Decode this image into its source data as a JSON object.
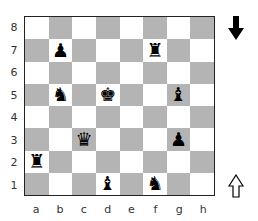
{
  "board": {
    "ranks": [
      "8",
      "7",
      "6",
      "5",
      "4",
      "3",
      "2",
      "1"
    ],
    "files": [
      "a",
      "b",
      "c",
      "d",
      "e",
      "f",
      "g",
      "h"
    ],
    "pieces": [
      {
        "square": "b7",
        "color": "black",
        "type": "pawn",
        "glyph": "♟"
      },
      {
        "square": "f7",
        "color": "black",
        "type": "rook",
        "glyph": "♜"
      },
      {
        "square": "b5",
        "color": "black",
        "type": "knight",
        "glyph": "♞"
      },
      {
        "square": "d5",
        "color": "black",
        "type": "king",
        "glyph": "♚"
      },
      {
        "square": "g5",
        "color": "black",
        "type": "bishop",
        "glyph": "♝"
      },
      {
        "square": "c3",
        "color": "black",
        "type": "queen",
        "glyph": "♛"
      },
      {
        "square": "g3",
        "color": "black",
        "type": "pawn",
        "glyph": "♟"
      },
      {
        "square": "a2",
        "color": "black",
        "type": "rook",
        "glyph": "♜"
      },
      {
        "square": "d1",
        "color": "black",
        "type": "bishop",
        "glyph": "♝"
      },
      {
        "square": "f1",
        "color": "black",
        "type": "knight",
        "glyph": "♞"
      }
    ],
    "colors": {
      "light": "#ffffff",
      "dark": "#b4b4b4",
      "border": "#222222"
    }
  },
  "indicators": {
    "top": {
      "icon": "black-arrow-down-icon",
      "meaning": "black side"
    },
    "bottom": {
      "icon": "white-arrow-up-icon",
      "meaning": "white side"
    }
  }
}
